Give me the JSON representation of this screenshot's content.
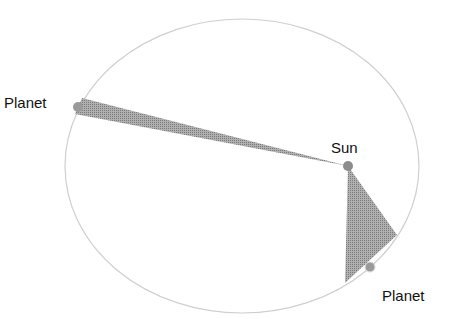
{
  "diagram": {
    "labels": {
      "planet_left": "Planet",
      "sun": "Sun",
      "planet_right": "Planet"
    },
    "colors": {
      "orbit": "#c8c8c8",
      "sweep": "#9a9a9a",
      "body": "#8c8c8c",
      "text": "#111111"
    }
  }
}
